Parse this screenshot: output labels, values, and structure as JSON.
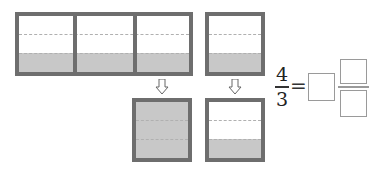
{
  "diagram": {
    "top_row": {
      "big_container": {
        "cells": 3,
        "parts_per_cell": 3,
        "filled_parts_per_cell": 1
      },
      "small_container": {
        "parts": 3,
        "filled_parts": 1
      }
    },
    "bottom_row": {
      "left_container": {
        "parts": 3,
        "filled_parts": 3
      },
      "right_container": {
        "parts": 3,
        "filled_parts": 1
      }
    },
    "arrows": [
      "down-arrow",
      "down-arrow"
    ],
    "colors": {
      "border": "#6e6e6e",
      "fill": "#c8c8c8",
      "dash": "#b0b0b0"
    }
  },
  "equation": {
    "numerator": "4",
    "denominator": "3",
    "equals": "=",
    "whole_blank": "",
    "numerator_blank": "",
    "denominator_blank": ""
  }
}
